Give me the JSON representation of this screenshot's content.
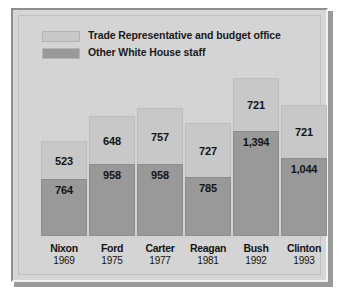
{
  "chart_data": {
    "type": "bar",
    "subtype": "stacked-bar",
    "title": "",
    "xlabel": "",
    "ylabel": "",
    "grid": false,
    "legend_position": "top-left",
    "categories": [
      "Nixon",
      "Ford",
      "Carter",
      "Reagan",
      "Bush",
      "Clinton"
    ],
    "category_sublabels": [
      "1969",
      "1975",
      "1977",
      "1981",
      "1992",
      "1993"
    ],
    "series": [
      {
        "name": "Trade Representative and budget office",
        "color": "#c8c8c8",
        "values": [
          523,
          648,
          757,
          727,
          721,
          721
        ],
        "value_labels": [
          "523",
          "648",
          "757",
          "727",
          "721",
          "721"
        ]
      },
      {
        "name": "Other White House staff",
        "color": "#999999",
        "values": [
          764,
          958,
          958,
          785,
          1394,
          1044
        ],
        "value_labels": [
          "764",
          "958",
          "958",
          "785",
          "1,394",
          "1,044"
        ]
      }
    ],
    "totals": [
      1287,
      1606,
      1715,
      1512,
      2115,
      1765
    ],
    "ylim": [
      0,
      2115
    ]
  },
  "legend": {
    "items": [
      {
        "label": "Trade Representative and budget office",
        "swatch": "light"
      },
      {
        "label": "Other White House staff",
        "swatch": "dark"
      }
    ]
  },
  "colors": {
    "series_light": "#c8c8c8",
    "series_dark": "#999999",
    "panel": "#d4d4d4",
    "frame": "#d6d6d6",
    "text": "#141414"
  }
}
